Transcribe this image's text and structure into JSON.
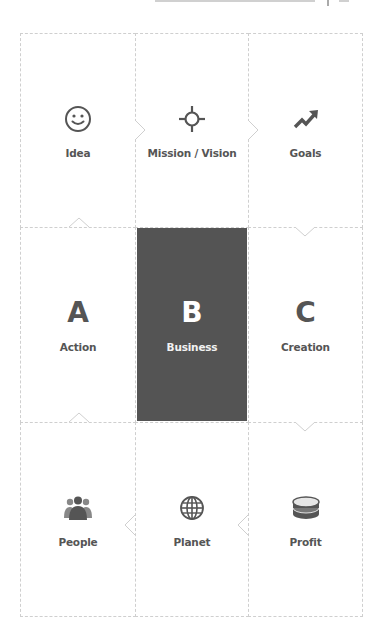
{
  "diagram": {
    "type": "3x3 grid flow diagram",
    "colors": {
      "border": "#cfcfcf",
      "text": "#555555",
      "highlight_fill": "#545454",
      "highlight_text": "#ffffff"
    },
    "rows": [
      {
        "cells": [
          {
            "label": "Idea",
            "icon": "smiley-face-icon"
          },
          {
            "label": "Mission / Vision",
            "icon": "crosshair-target-icon"
          },
          {
            "label": "Goals",
            "icon": "trending-up-arrow-icon"
          }
        ],
        "flow": "left-to-right"
      },
      {
        "cells": [
          {
            "letter": "A",
            "label": "Action"
          },
          {
            "letter": "B",
            "label": "Business",
            "highlighted": true
          },
          {
            "letter": "C",
            "label": "Creation"
          }
        ]
      },
      {
        "cells": [
          {
            "label": "People",
            "icon": "people-group-icon"
          },
          {
            "label": "Planet",
            "icon": "globe-icon"
          },
          {
            "label": "Profit",
            "icon": "coin-stack-icon"
          }
        ],
        "flow": "right-to-left"
      }
    ],
    "connectors": [
      {
        "from": "Idea",
        "to": "Mission / Vision",
        "direction": "right"
      },
      {
        "from": "Mission / Vision",
        "to": "Goals",
        "direction": "right"
      },
      {
        "from": "Goals",
        "to": "Creation",
        "direction": "down"
      },
      {
        "from": "Creation",
        "to": "Profit",
        "direction": "down"
      },
      {
        "from": "Profit",
        "to": "Planet",
        "direction": "left"
      },
      {
        "from": "Planet",
        "to": "People",
        "direction": "left"
      },
      {
        "from": "People",
        "to": "Action",
        "direction": "up"
      },
      {
        "from": "Action",
        "to": "Idea",
        "direction": "up"
      }
    ]
  }
}
